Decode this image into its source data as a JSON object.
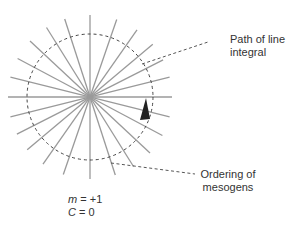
{
  "diagram": {
    "type": "radial topological defect (aster)",
    "center": [
      90,
      97
    ],
    "ray_length": 82,
    "line_angles_deg": [
      0,
      14,
      27,
      40,
      55,
      71,
      90,
      108,
      122,
      137,
      152,
      166
    ],
    "line_color": "#9a9a9a",
    "path_circle": {
      "radius": 63,
      "style": "dashed",
      "color": "#444444"
    },
    "arrow": {
      "color": "#222222",
      "position": [
        143,
        110
      ],
      "direction": "up"
    }
  },
  "annotations": {
    "path_label_line1": "Path of line",
    "path_label_line2": "integral",
    "ordering_label_line1": "Ordering of",
    "ordering_label_line2": "mesogens"
  },
  "equations": {
    "m_symbol": "m",
    "m_value": " = +1",
    "c_symbol": "C",
    "c_value": " = 0"
  }
}
